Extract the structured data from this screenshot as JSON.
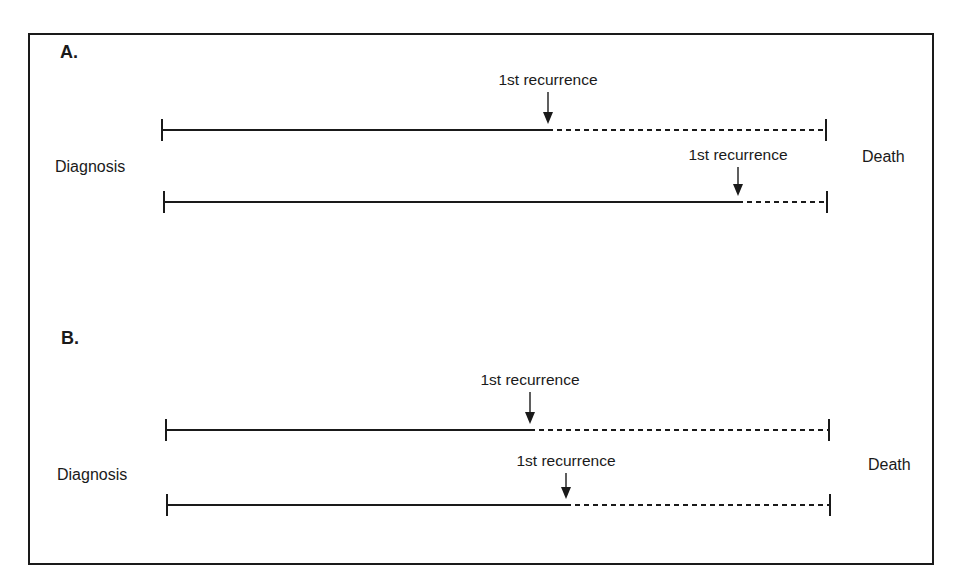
{
  "panels": [
    {
      "label": "A.",
      "start_label": "Diagnosis",
      "end_label": "Death",
      "timelines": [
        {
          "recurrence_label": "1st recurrence",
          "y": 130,
          "x_start": 162,
          "x_recurrence": 548,
          "x_end": 826,
          "label_y": 71
        },
        {
          "recurrence_label": "1st recurrence",
          "y": 202,
          "x_start": 164,
          "x_recurrence": 738,
          "x_end": 827,
          "label_y": 146
        }
      ]
    },
    {
      "label": "B.",
      "start_label": "Diagnosis",
      "end_label": "Death",
      "timelines": [
        {
          "recurrence_label": "1st recurrence",
          "y": 430,
          "x_start": 166,
          "x_recurrence": 530,
          "x_end": 829,
          "label_y": 371
        },
        {
          "recurrence_label": "1st recurrence",
          "y": 505,
          "x_start": 167,
          "x_recurrence": 566,
          "x_end": 830,
          "label_y": 452
        }
      ]
    }
  ],
  "legend": {
    "solid_segment": "Diagnosis to 1st recurrence",
    "dashed_segment": "1st recurrence to death"
  },
  "colors": {
    "line": "#1a1a1a",
    "background": "#ffffff"
  }
}
